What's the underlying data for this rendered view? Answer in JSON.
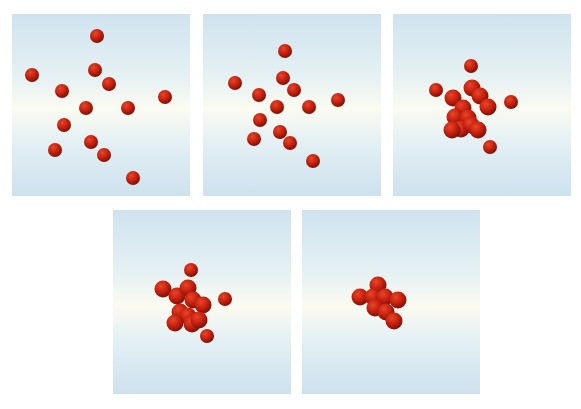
{
  "figure": {
    "colors": {
      "sphere_highlight": "#e8452a",
      "sphere_mid": "#c4200e",
      "sphere_shadow": "#7a0f06",
      "background_top": "#cfe3ef",
      "background_center": "#fbfbf1",
      "background_bottom": "#cde1ee"
    },
    "panels": [
      {
        "id": "frame-1",
        "x": 12,
        "y": 14,
        "w": 178,
        "h": 182,
        "spheres": [
          [
            97,
            36,
            7
          ],
          [
            32,
            75,
            7
          ],
          [
            95,
            70,
            7
          ],
          [
            109,
            84,
            7
          ],
          [
            62,
            91,
            7
          ],
          [
            165,
            97,
            7
          ],
          [
            86,
            108,
            7
          ],
          [
            128,
            108,
            7
          ],
          [
            64,
            125,
            7
          ],
          [
            91,
            142,
            7
          ],
          [
            55,
            150,
            7
          ],
          [
            104,
            155,
            7
          ],
          [
            133,
            178,
            7
          ]
        ],
        "blobs": []
      },
      {
        "id": "frame-2",
        "x": 203,
        "y": 14,
        "w": 178,
        "h": 182,
        "spheres": [
          [
            285,
            51,
            7
          ],
          [
            235,
            83,
            7
          ],
          [
            283,
            78,
            7
          ],
          [
            294,
            90,
            7
          ],
          [
            259,
            95,
            7
          ],
          [
            338,
            100,
            7
          ],
          [
            277,
            107,
            7
          ],
          [
            309,
            107,
            7
          ],
          [
            260,
            120,
            7
          ],
          [
            254,
            139,
            7
          ],
          [
            280,
            132,
            7
          ],
          [
            290,
            143,
            7
          ],
          [
            313,
            161,
            7
          ]
        ],
        "blobs": []
      },
      {
        "id": "frame-3",
        "x": 393,
        "y": 14,
        "w": 178,
        "h": 182,
        "spheres": [
          [
            471,
            66,
            7
          ],
          [
            436,
            90,
            7
          ],
          [
            511,
            102,
            7
          ],
          [
            490,
            147,
            7
          ]
        ],
        "blobs": [
          [
            [
              472,
              88
            ],
            [
              480,
              96
            ],
            [
              488,
              107
            ],
            [
              453,
              98
            ],
            [
              463,
              108
            ],
            [
              455,
              117
            ],
            [
              468,
              118
            ],
            [
              461,
              129
            ],
            [
              471,
              125
            ],
            [
              478,
              130
            ],
            [
              452,
              130
            ]
          ]
        ]
      },
      {
        "id": "frame-4",
        "x": 113,
        "y": 210,
        "w": 178,
        "h": 184,
        "spheres": [
          [
            191,
            270,
            7
          ],
          [
            225,
            299,
            7
          ],
          [
            207,
            336,
            7
          ]
        ],
        "blobs": [
          [
            [
              163,
              289
            ],
            [
              177,
              296
            ],
            [
              188,
              288
            ],
            [
              193,
              300
            ],
            [
              203,
              305
            ],
            [
              180,
              312
            ],
            [
              188,
              316
            ],
            [
              175,
              323
            ],
            [
              192,
              324
            ],
            [
              199,
              320
            ]
          ]
        ]
      },
      {
        "id": "frame-5",
        "x": 302,
        "y": 210,
        "w": 178,
        "h": 184,
        "spheres": [],
        "blobs": [
          [
            [
              378,
              285
            ],
            [
              360,
              297
            ],
            [
              373,
              297
            ],
            [
              385,
              297
            ],
            [
              398,
              300
            ],
            [
              375,
              308
            ],
            [
              386,
              312
            ],
            [
              394,
              321
            ]
          ]
        ]
      }
    ]
  }
}
